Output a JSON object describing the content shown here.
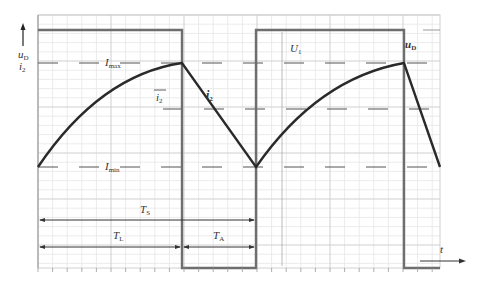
{
  "diagram": {
    "type": "waveform",
    "axes": {
      "y_label_main": "u",
      "y_label_main_sub": "D",
      "y_label_second": "i",
      "y_label_second_sub": "2",
      "x_label": "t"
    },
    "levels": {
      "imax_label": "I",
      "imax_sub": "max",
      "imin_label": "I",
      "imin_sub": "min",
      "mean_label": "i",
      "mean_sub": "2",
      "u1_label": "U",
      "u1_sub": "1"
    },
    "curves": {
      "current_label": "i",
      "current_sub": "2",
      "voltage_label": "u",
      "voltage_sub": "D"
    },
    "intervals": {
      "ts_label": "T",
      "ts_sub": "S",
      "tl_label": "T",
      "tl_sub": "L",
      "ta_label": "T",
      "ta_sub": "A"
    },
    "colors": {
      "grid_minor": "#e4e4e4",
      "grid_major": "#c8c8c8",
      "square_wave": "#6e6e6e",
      "current": "#2a2a2a",
      "dashed": "#555555",
      "arrows": "#333333"
    }
  }
}
